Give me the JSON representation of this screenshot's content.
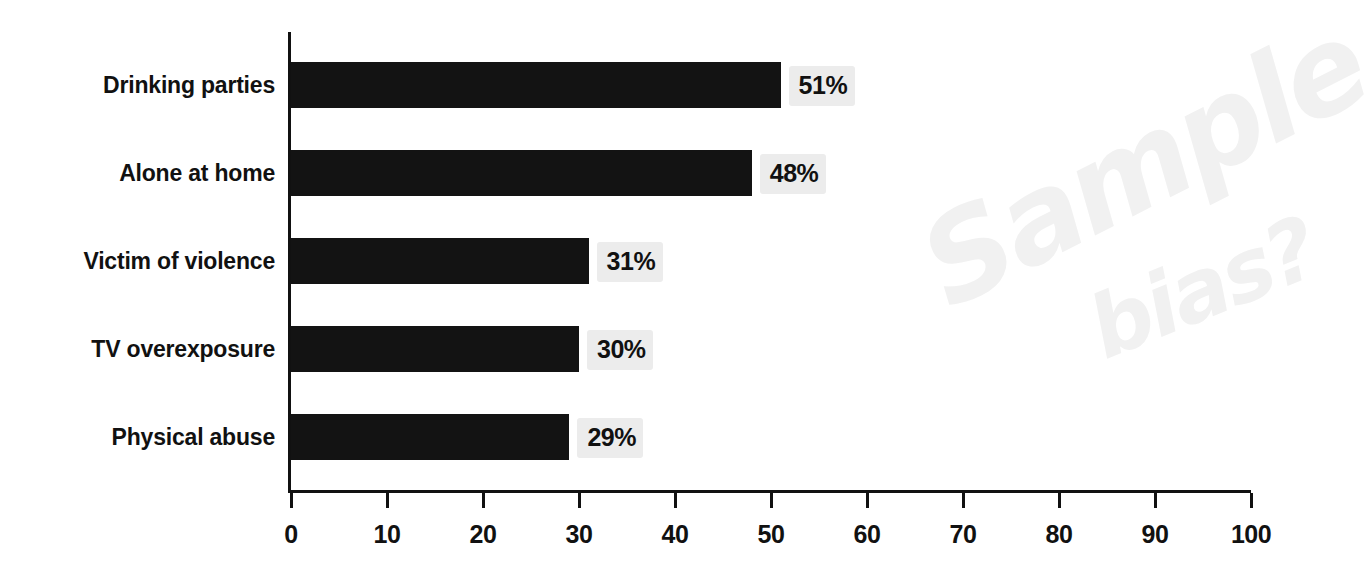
{
  "chart_data": {
    "type": "bar",
    "orientation": "horizontal",
    "title": "",
    "subtitle": "",
    "xlabel": "",
    "ylabel": "",
    "xlim": [
      0,
      100
    ],
    "grid": false,
    "legend": null,
    "categories": [
      "Drinking parties",
      "Alone at home",
      "Victim of violence",
      "TV overexposure",
      "Physical abuse"
    ],
    "values": [
      51,
      48,
      31,
      30,
      29
    ],
    "value_labels": [
      "51%",
      "48%",
      "31%",
      "30%",
      "29%"
    ],
    "xticks": [
      0,
      10,
      20,
      30,
      40,
      50,
      60,
      70,
      80,
      90,
      100
    ],
    "xtick_labels": [
      "0",
      "10",
      "20",
      "30",
      "40",
      "50",
      "60",
      "70",
      "80",
      "90",
      "100"
    ],
    "bar_color": "#131313",
    "axis_color": "#111111",
    "value_label_highlight_color": "#ececec",
    "background_color": "#ffffff"
  },
  "annotations": {
    "watermark_color": "#f1f1f1",
    "lines": [
      {
        "text": "Sample"
      },
      {
        "text": "bias?"
      }
    ]
  }
}
